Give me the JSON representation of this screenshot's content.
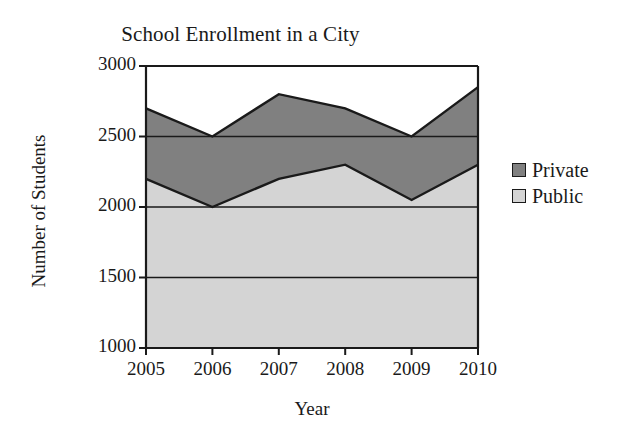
{
  "chart_data": {
    "type": "area",
    "stacked": true,
    "title": "School Enrollment in a City",
    "xlabel": "Year",
    "ylabel": "Number of Students",
    "categories": [
      "2005",
      "2006",
      "2007",
      "2008",
      "2009",
      "2010"
    ],
    "x": [
      2005,
      2006,
      2007,
      2008,
      2009,
      2010
    ],
    "series": [
      {
        "name": "Private",
        "values": [
          500,
          500,
          600,
          400,
          450,
          550
        ],
        "color": "#808080"
      },
      {
        "name": "Public",
        "values": [
          2200,
          2000,
          2200,
          2300,
          2050,
          2300
        ],
        "color": "#d4d4d4"
      }
    ],
    "totals": [
      2700,
      2500,
      2800,
      2700,
      2500,
      2850
    ],
    "ylim": [
      1000,
      3000
    ],
    "yticks": [
      3000,
      2500,
      2000,
      1500,
      1000
    ],
    "ytick_labels": [
      "3000",
      "2500",
      "2000",
      "1500",
      "1000"
    ],
    "xtick_labels": [
      "2005",
      "2006",
      "2007",
      "2008",
      "2009",
      "2010"
    ],
    "grid": true,
    "legend_position": "right",
    "legend": [
      {
        "label": "Private",
        "color": "#808080"
      },
      {
        "label": "Public",
        "color": "#d4d4d4"
      }
    ],
    "axis_color": "#1a1a1a",
    "background": "#ffffff"
  }
}
